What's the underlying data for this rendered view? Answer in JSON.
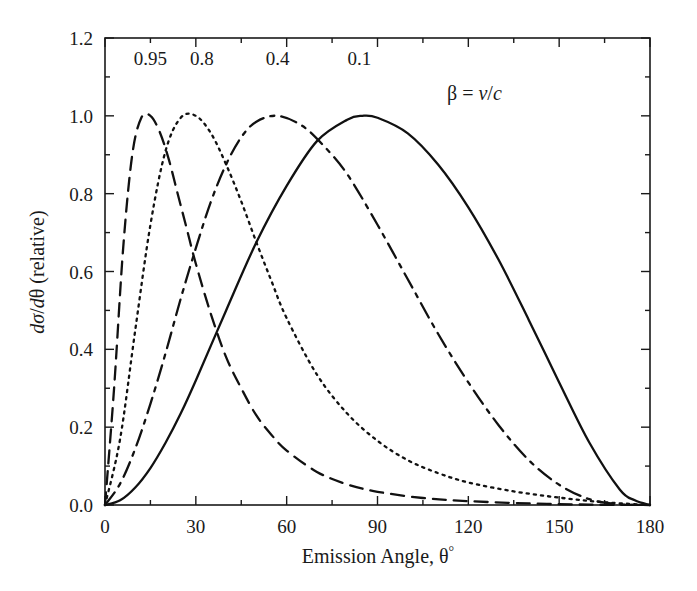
{
  "figure": {
    "background": "#ffffff",
    "ink_color": "#111111"
  },
  "axes": {
    "x_title_main": "Emission Angle, ",
    "x_title_symbol": "θ",
    "x_title_degree": "°",
    "y_title_d1": "d",
    "y_title_sigma": "σ",
    "y_title_slash": "/",
    "y_title_d2": "d",
    "y_title_theta": "θ",
    "y_title_rest": " (relative)"
  },
  "legend": {
    "beta_symbol": "β",
    "equals": " = ",
    "v_symbol": "v",
    "slash": "/",
    "c_symbol": "c",
    "full": "β = v/c"
  },
  "curve_labels": [
    {
      "text": "0.95",
      "x_deg": 15,
      "y_val": 1.13
    },
    {
      "text": "0.8",
      "x_deg": 32,
      "y_val": 1.13
    },
    {
      "text": "0.4",
      "x_deg": 57,
      "y_val": 1.13
    },
    {
      "text": "0.1",
      "x_deg": 84,
      "y_val": 1.13
    }
  ],
  "chart_data": {
    "type": "line",
    "title": "",
    "xlabel": "Emission Angle, θ°",
    "ylabel": "dσ/dθ (relative)",
    "xlim": [
      0,
      180
    ],
    "ylim": [
      0.0,
      1.2
    ],
    "xticks": [
      0,
      30,
      60,
      90,
      120,
      150,
      180
    ],
    "xticklabels": [
      "0",
      "30",
      "60",
      "90",
      "120",
      "150",
      "180"
    ],
    "xminorticks": [
      15,
      45,
      75,
      105,
      135,
      165
    ],
    "yticks": [
      0.0,
      0.2,
      0.4,
      0.6,
      0.8,
      1.0,
      1.2
    ],
    "yticklabels": [
      "0.0",
      "0.2",
      "0.4",
      "0.6",
      "0.8",
      "1.0",
      "1.2"
    ],
    "yminorticks": [
      0.1,
      0.3,
      0.5,
      0.7,
      0.9,
      1.1
    ],
    "grid": false,
    "legend_position": "inside-top-right",
    "legend_entries": [
      "0.95",
      "0.8",
      "0.4",
      "0.1"
    ],
    "annotations": [
      "β = v/c"
    ],
    "series": [
      {
        "name": "0.95",
        "beta": 0.95,
        "style": "dashed",
        "peak_deg": 15,
        "x": [
          0,
          3,
          6,
          9,
          12,
          15,
          18,
          21,
          24,
          27,
          30,
          35,
          40,
          45,
          50,
          55,
          60,
          70,
          80,
          90,
          105,
          120,
          140,
          160,
          180
        ],
        "y": [
          0.0,
          0.3,
          0.66,
          0.9,
          0.995,
          1.0,
          0.96,
          0.89,
          0.8,
          0.71,
          0.62,
          0.49,
          0.38,
          0.3,
          0.23,
          0.18,
          0.14,
          0.085,
          0.053,
          0.034,
          0.018,
          0.01,
          0.004,
          0.001,
          0.0
        ]
      },
      {
        "name": "0.8",
        "beta": 0.8,
        "style": "dotted",
        "peak_deg": 30,
        "x": [
          0,
          5,
          10,
          15,
          20,
          25,
          30,
          35,
          40,
          45,
          50,
          55,
          60,
          70,
          80,
          90,
          100,
          110,
          120,
          135,
          150,
          165,
          180
        ],
        "y": [
          0.0,
          0.17,
          0.45,
          0.72,
          0.91,
          0.995,
          1.0,
          0.955,
          0.875,
          0.78,
          0.675,
          0.575,
          0.48,
          0.335,
          0.235,
          0.165,
          0.115,
          0.082,
          0.058,
          0.035,
          0.019,
          0.007,
          0.0
        ]
      },
      {
        "name": "0.4",
        "beta": 0.4,
        "style": "dashdot",
        "peak_deg": 57,
        "x": [
          0,
          5,
          10,
          15,
          20,
          25,
          30,
          35,
          40,
          45,
          50,
          57,
          65,
          72,
          80,
          90,
          100,
          110,
          120,
          130,
          140,
          150,
          160,
          170,
          180
        ],
        "y": [
          0.0,
          0.055,
          0.145,
          0.26,
          0.39,
          0.53,
          0.66,
          0.78,
          0.875,
          0.945,
          0.985,
          1.0,
          0.975,
          0.925,
          0.85,
          0.72,
          0.58,
          0.44,
          0.315,
          0.205,
          0.115,
          0.052,
          0.015,
          0.002,
          0.0
        ]
      },
      {
        "name": "0.1",
        "beta": 0.1,
        "style": "solid",
        "peak_deg": 85,
        "x": [
          0,
          5,
          10,
          15,
          20,
          25,
          30,
          40,
          50,
          60,
          70,
          80,
          85,
          90,
          100,
          110,
          120,
          130,
          140,
          150,
          160,
          170,
          175,
          180
        ],
        "y": [
          0.0,
          0.012,
          0.045,
          0.095,
          0.16,
          0.235,
          0.32,
          0.5,
          0.675,
          0.82,
          0.935,
          0.99,
          1.0,
          0.995,
          0.955,
          0.875,
          0.765,
          0.63,
          0.475,
          0.315,
          0.16,
          0.04,
          0.012,
          0.0
        ]
      }
    ]
  }
}
